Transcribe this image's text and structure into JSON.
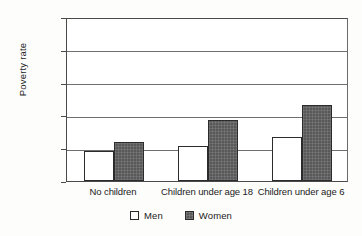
{
  "chart_data": {
    "type": "bar",
    "title": "",
    "subtitle": "",
    "xlabel": "",
    "ylabel": "Poverty rate",
    "categories": [
      "No children",
      "Children under age 18",
      "Children under age 6"
    ],
    "series": [
      {
        "name": "Men",
        "values": [
          9.1,
          10.8,
          13.5
        ]
      },
      {
        "name": "Women",
        "values": [
          12.0,
          18.7,
          23.3
        ]
      }
    ],
    "ylim": [
      0,
      50
    ],
    "ytick_values": [
      0,
      10,
      20,
      30,
      40,
      50
    ],
    "ytick_labels": [
      "0%",
      "10%",
      "20%",
      "30%",
      "40%",
      "50%"
    ],
    "grid": true,
    "grid_axis": "y",
    "legend_position": "bottom-center",
    "value_unit": "%",
    "colors": {
      "men": "#ffffff",
      "women": "#595959",
      "outline": "#2b2b2b",
      "gridline": "#6f6f6f",
      "axis": "#4a4a4a",
      "background": "#fdfdfb",
      "plot_background": "#ffffff",
      "text": "#1b1b1b"
    }
  },
  "legend": {
    "items": [
      {
        "label": "Men",
        "swatch": "legend-swatch-men"
      },
      {
        "label": "Women",
        "swatch": "legend-swatch-women"
      }
    ]
  }
}
